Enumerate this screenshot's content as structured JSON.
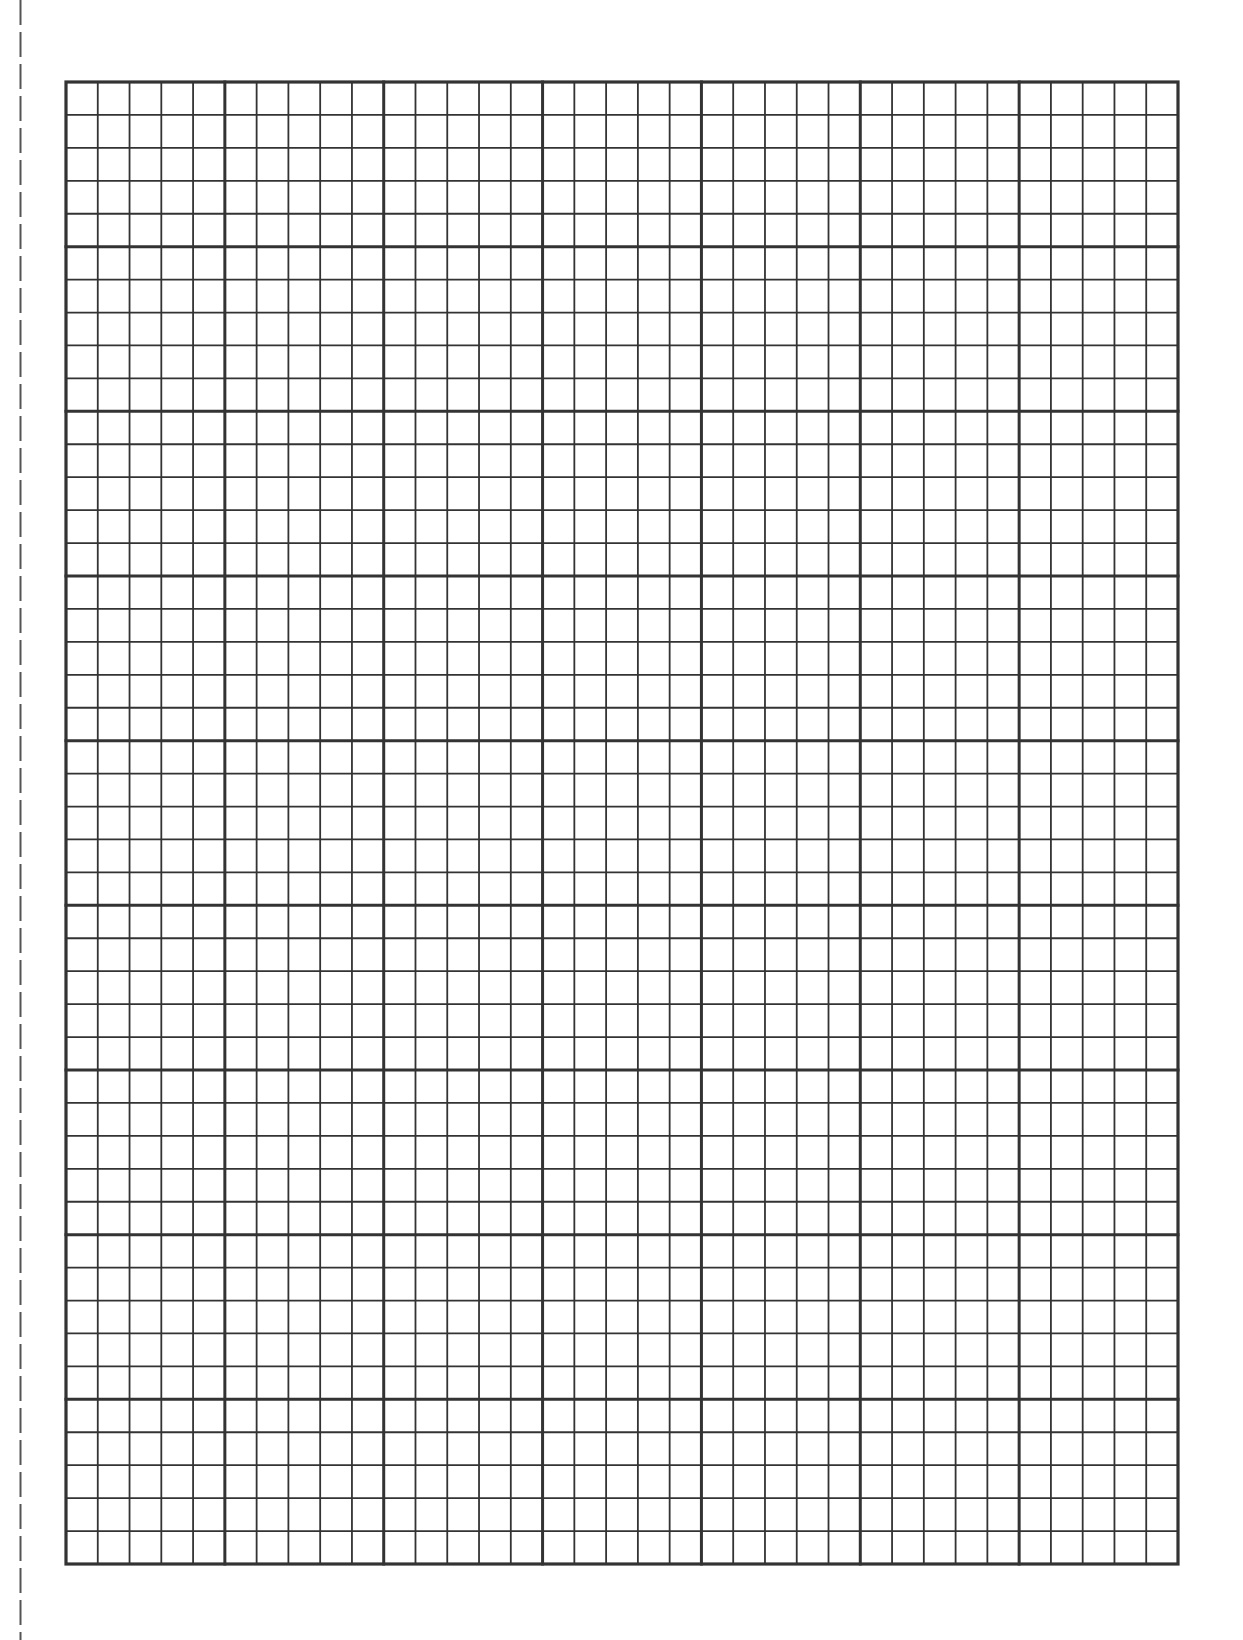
{
  "document": {
    "type": "graph-paper",
    "background": "#ffffff"
  },
  "cut_line": {
    "style": "dashed",
    "x": 20,
    "dash": 25,
    "gap": 7,
    "color": "#555555"
  },
  "grid": {
    "left": 66,
    "top": 82,
    "right": 1178,
    "bottom": 1564,
    "columns": 35,
    "rows": 45,
    "major_every": 5,
    "line_color": "#333333",
    "minor_width": 1.8,
    "major_width": 3,
    "border_width": 3.2
  }
}
